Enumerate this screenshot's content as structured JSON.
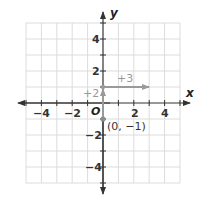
{
  "graph": {
    "x_axis_label": "x",
    "y_axis_label": "y",
    "origin_label": "O",
    "x_tick_labels": [
      "−4",
      "−2",
      "2",
      "4"
    ],
    "y_tick_labels": [
      "4",
      "2",
      "−2",
      "−4"
    ],
    "x_range": [
      -5,
      5
    ],
    "y_range": [
      -5,
      5
    ],
    "grid": true,
    "point": {
      "label": "(0, −1)",
      "x": 0,
      "y": -1
    },
    "vertical_move": {
      "label": "+2",
      "from": [
        0,
        -1
      ],
      "to": [
        0,
        1
      ]
    },
    "horizontal_move": {
      "label": "+3",
      "from": [
        0,
        1
      ],
      "to": [
        3,
        1
      ]
    },
    "colors": {
      "grid": "#d9d9d9",
      "axis": "#333333",
      "move_arrow": "#9a9a9a",
      "point": "#8c8c8c",
      "annotation": "#9a9a9a"
    }
  }
}
